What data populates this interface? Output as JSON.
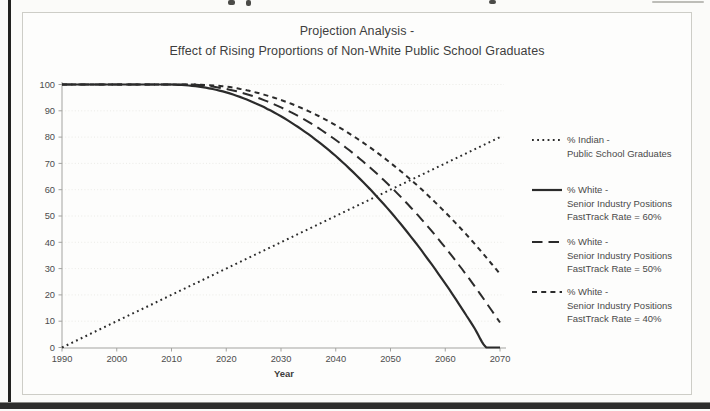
{
  "chart": {
    "title_lines": [
      "Projection Analysis -",
      "Effect of Rising Proportions of Non-White Public School Graduates"
    ]
  },
  "chart_data": {
    "type": "line",
    "title": "Projection Analysis - Effect of Rising Proportions of Non-White Public School Graduates",
    "xlabel": "Year",
    "ylabel": "",
    "xlim": [
      1990,
      2070
    ],
    "ylim": [
      0,
      100
    ],
    "x_ticks": [
      1990,
      2000,
      2010,
      2020,
      2030,
      2040,
      2050,
      2060,
      2070
    ],
    "y_ticks": [
      0,
      10,
      20,
      30,
      40,
      50,
      60,
      70,
      80,
      90,
      100
    ],
    "grid": "faint-horizontal",
    "legend_position": "right",
    "series": [
      {
        "name": "% Indian - Public School Graduates",
        "line_style": "dotted",
        "points": [
          [
            1990,
            0
          ],
          [
            2000,
            10
          ],
          [
            2010,
            20
          ],
          [
            2020,
            30
          ],
          [
            2030,
            40
          ],
          [
            2040,
            50
          ],
          [
            2050,
            60
          ],
          [
            2060,
            70
          ],
          [
            2070,
            80
          ]
        ]
      },
      {
        "name": "% White - Senior Industry Positions FastTrack Rate = 60%",
        "line_style": "solid",
        "points": [
          [
            1990,
            100
          ],
          [
            2005,
            100
          ],
          [
            2010,
            100
          ],
          [
            2015,
            99.2
          ],
          [
            2020,
            97
          ],
          [
            2025,
            93.2
          ],
          [
            2030,
            87.9
          ],
          [
            2035,
            81.1
          ],
          [
            2040,
            72.8
          ],
          [
            2045,
            62.9
          ],
          [
            2050,
            51.6
          ],
          [
            2055,
            38.7
          ],
          [
            2060,
            24.3
          ],
          [
            2065,
            8.5
          ],
          [
            2067.5,
            0
          ],
          [
            2070,
            0
          ]
        ]
      },
      {
        "name": "% White - Senior Industry Positions FastTrack Rate = 50%",
        "line_style": "dash-long",
        "points": [
          [
            1990,
            100
          ],
          [
            2008,
            100
          ],
          [
            2012,
            100
          ],
          [
            2015,
            99.8
          ],
          [
            2020,
            98.3
          ],
          [
            2025,
            95.5
          ],
          [
            2030,
            91.3
          ],
          [
            2035,
            85.8
          ],
          [
            2040,
            78.9
          ],
          [
            2045,
            70.7
          ],
          [
            2050,
            61.2
          ],
          [
            2055,
            50.3
          ],
          [
            2060,
            38
          ],
          [
            2065,
            24.4
          ],
          [
            2070,
            9.5
          ]
        ]
      },
      {
        "name": "% White - Senior Industry Positions FastTrack Rate = 40%",
        "line_style": "dash-short",
        "points": [
          [
            1990,
            100
          ],
          [
            2010,
            100
          ],
          [
            2014,
            100
          ],
          [
            2020,
            99.2
          ],
          [
            2025,
            97.2
          ],
          [
            2030,
            94.1
          ],
          [
            2035,
            89.9
          ],
          [
            2040,
            84.5
          ],
          [
            2045,
            77.9
          ],
          [
            2050,
            70.2
          ],
          [
            2055,
            61.4
          ],
          [
            2060,
            51.4
          ],
          [
            2065,
            40.3
          ],
          [
            2070,
            28
          ]
        ]
      }
    ]
  },
  "legend": {
    "entries": [
      {
        "style": "dotted",
        "lines": [
          "% Indian -",
          "Public School Graduates"
        ]
      },
      {
        "style": "solid",
        "lines": [
          "% White -",
          "Senior Industry Positions",
          "FastTrack Rate = 60%"
        ]
      },
      {
        "style": "dash-long",
        "lines": [
          "% White -",
          "Senior Industry Positions",
          "FastTrack Rate = 50%"
        ]
      },
      {
        "style": "dash-short",
        "lines": [
          "% White -",
          "Senior Industry Positions",
          "FastTrack Rate = 40%"
        ]
      }
    ]
  },
  "colors": {
    "line": "#2b2b2b",
    "text": "#4a4a4a",
    "tick_text": "#4c4c4c",
    "axis": "#a3a3a0",
    "grid": "#e7e7e2",
    "frame": "#cdcdc7",
    "page_edge": "#222220"
  }
}
